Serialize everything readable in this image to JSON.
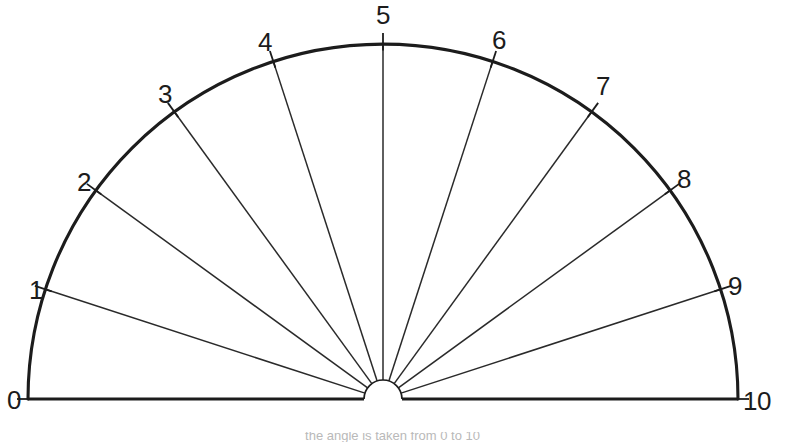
{
  "figure": {
    "background_color": "#ffffff",
    "stroke_color": "#1c1c1c",
    "line_color": "#2a2a2a",
    "width": 785,
    "height": 442
  },
  "geometry": {
    "center_x": 383,
    "center_y": 399,
    "outer_radius": 355,
    "hub_radius": 19,
    "tick_overshoot": 11,
    "start_angle_deg": 180,
    "end_angle_deg": 0,
    "division_count": 10
  },
  "labels": [
    {
      "text": "0",
      "index": 0,
      "angle_deg": 180,
      "x": 14,
      "y": 402,
      "anchor": "middle"
    },
    {
      "text": "1",
      "index": 1,
      "angle_deg": 162,
      "x": 36,
      "y": 292,
      "anchor": "middle"
    },
    {
      "text": "2",
      "index": 2,
      "angle_deg": 144,
      "x": 84,
      "y": 184,
      "anchor": "middle"
    },
    {
      "text": "3",
      "index": 3,
      "angle_deg": 126,
      "x": 165,
      "y": 96,
      "anchor": "middle"
    },
    {
      "text": "4",
      "index": 4,
      "angle_deg": 108,
      "x": 265,
      "y": 44,
      "anchor": "middle"
    },
    {
      "text": "5",
      "index": 5,
      "angle_deg": 90,
      "x": 383,
      "y": 17,
      "anchor": "middle"
    },
    {
      "text": "6",
      "index": 6,
      "angle_deg": 72,
      "x": 499,
      "y": 42,
      "anchor": "middle"
    },
    {
      "text": "7",
      "index": 7,
      "angle_deg": 54,
      "x": 603,
      "y": 88,
      "anchor": "middle"
    },
    {
      "text": "8",
      "index": 8,
      "angle_deg": 36,
      "x": 684,
      "y": 181,
      "anchor": "middle"
    },
    {
      "text": "9",
      "index": 9,
      "angle_deg": 18,
      "x": 735,
      "y": 288,
      "anchor": "middle"
    },
    {
      "text": "10",
      "index": 10,
      "angle_deg": 0,
      "x": 757,
      "y": 403,
      "anchor": "middle"
    }
  ],
  "caption": {
    "text": "the angle is taken from 0 to 10"
  }
}
